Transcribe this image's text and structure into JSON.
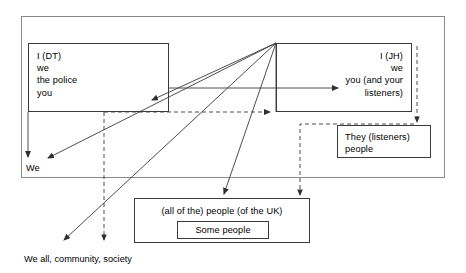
{
  "diagram": {
    "outer_frame": {
      "name": "broadcast interaction frame"
    },
    "nodes": {
      "box_dt": {
        "lines": [
          "I (DT)",
          "we",
          "the police",
          "you"
        ]
      },
      "box_jh": {
        "lines": [
          "I (JH)",
          "we",
          "you (and your",
          "listeners)"
        ]
      },
      "box_they": {
        "lines": [
          "They (listeners)",
          "people"
        ]
      },
      "box_uk": {
        "title": "(all of the) people (of the UK)",
        "inner_label": "Some people"
      }
    },
    "labels": {
      "we": "We",
      "we_all": "We all, community, society"
    },
    "colors": {
      "line": "#3a3a3a",
      "frame": "#8a8a8a",
      "text": "#000000",
      "background": "#ffffff"
    }
  }
}
